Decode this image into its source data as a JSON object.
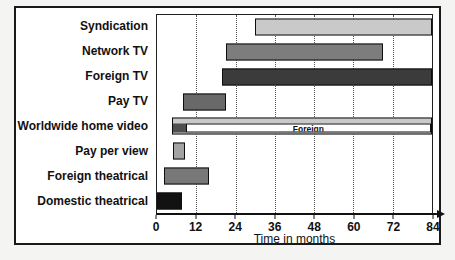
{
  "figure": {
    "background": "#f4f4f2",
    "frame_border_color": "#1a1a1a"
  },
  "chart_data": {
    "type": "bar",
    "subtype": "gantt-release-windows",
    "title": "",
    "xlabel": "Time in months",
    "xlim": [
      0,
      84
    ],
    "xticks": [
      0,
      12,
      24,
      36,
      48,
      60,
      72,
      84
    ],
    "gridlines": [
      12,
      24,
      36,
      48,
      60,
      72
    ],
    "grid_style": "dotted",
    "legend_position": "none",
    "rows": [
      {
        "label": "Syndication",
        "start": 30,
        "end": 84,
        "color": "#c9c9c9"
      },
      {
        "label": "Network TV",
        "start": 21,
        "end": 69,
        "color": "#7d7d7d"
      },
      {
        "label": "Foreign TV",
        "start": 20,
        "end": 84,
        "color": "#3b3b3b"
      },
      {
        "label": "Pay TV",
        "start": 8,
        "end": 21,
        "color": "#696969"
      },
      {
        "label": "Worldwide home video",
        "start": 4.5,
        "end": 84,
        "color": "#c9c9c9",
        "sub_segments": [
          {
            "label": "",
            "start": 4.5,
            "end": 8.5,
            "color": "#4f4f4f"
          },
          {
            "label": "Foreign",
            "start": 8.5,
            "end": 84,
            "color": "#ffffff"
          }
        ]
      },
      {
        "label": "Pay per view",
        "start": 5,
        "end": 8.5,
        "color": "#a3a3a3"
      },
      {
        "label": "Foreign theatrical",
        "start": 2,
        "end": 16,
        "color": "#787878"
      },
      {
        "label": "Domestic theatrical",
        "start": 0,
        "end": 7.5,
        "color": "#121212"
      }
    ]
  }
}
